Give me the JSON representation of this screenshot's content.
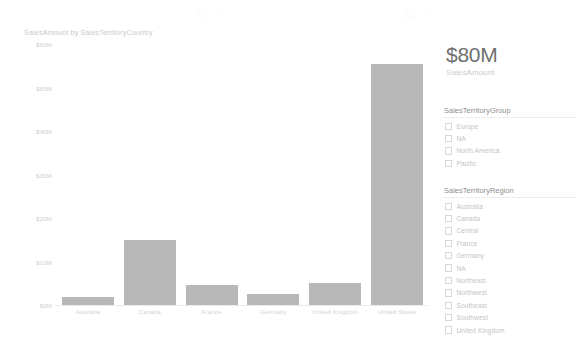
{
  "chart_visual": {
    "title": "SalesAmount by SalesTerritoryCountry",
    "header_icons": [
      {
        "name": "filter-icon"
      },
      {
        "name": "more-options-icon"
      },
      {
        "name": "focus-mode-icon"
      },
      {
        "name": "more-options-icon"
      }
    ]
  },
  "chart_data": {
    "type": "bar",
    "title": "SalesAmount by SalesTerritoryCountry",
    "xlabel": "",
    "ylabel": "",
    "categories": [
      "Australia",
      "Canada",
      "France",
      "Germany",
      "United Kingdom",
      "United States"
    ],
    "values": [
      1.9,
      15.0,
      4.7,
      2.6,
      5.0,
      55.5
    ],
    "value_unit": "$M",
    "ylim": [
      0,
      60
    ],
    "yticks": [
      0,
      10,
      20,
      30,
      40,
      50,
      60
    ],
    "ytick_labels": [
      "$0M",
      "$10M",
      "$20M",
      "$30M",
      "$40M",
      "$50M",
      "$60M"
    ],
    "grid": false,
    "legend": "none",
    "bar_color": "#b8b8b8"
  },
  "kpi_card": {
    "value": "$80M",
    "label": "SalesAmount"
  },
  "slicers": [
    {
      "name": "sales-territory-group",
      "header": "SalesTerritoryGroup",
      "items": [
        {
          "label": "Europe",
          "checked": false
        },
        {
          "label": "NA",
          "checked": false
        },
        {
          "label": "North America",
          "checked": false
        },
        {
          "label": "Pacific",
          "checked": false
        }
      ]
    },
    {
      "name": "sales-territory-region",
      "header": "SalesTerritoryRegion",
      "items": [
        {
          "label": "Australia",
          "checked": false
        },
        {
          "label": "Canada",
          "checked": false
        },
        {
          "label": "Central",
          "checked": false
        },
        {
          "label": "France",
          "checked": false
        },
        {
          "label": "Germany",
          "checked": false
        },
        {
          "label": "NA",
          "checked": false
        },
        {
          "label": "Northeast",
          "checked": false
        },
        {
          "label": "Northwest",
          "checked": false
        },
        {
          "label": "Southeast",
          "checked": false
        },
        {
          "label": "Southwest",
          "checked": false
        },
        {
          "label": "United Kingdom",
          "checked": false
        }
      ]
    }
  ],
  "theme": {
    "background": "#ffffff",
    "bar": "#b8b8b8",
    "text_muted": "#c9c9c9",
    "text_strong": "#707070"
  }
}
